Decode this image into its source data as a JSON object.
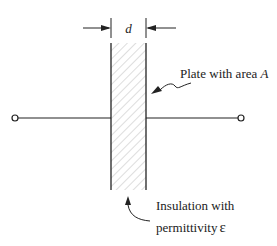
{
  "diagram": {
    "dimension_label": "d",
    "plate_label_prefix": "Plate with area ",
    "plate_label_var": "A",
    "insulation_line1": "Insulation with",
    "insulation_line2_prefix": "permittivity",
    "insulation_line2_var": "ε",
    "colors": {
      "line": "#222222",
      "hatch": "#bbbbbb",
      "background": "#ffffff"
    }
  }
}
